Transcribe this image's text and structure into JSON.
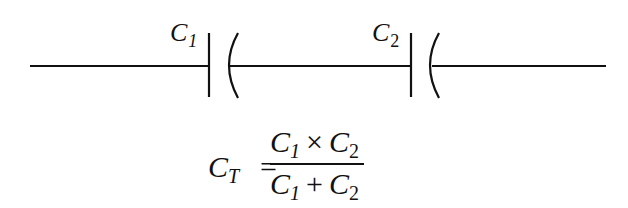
{
  "diagram": {
    "type": "series-capacitor-circuit",
    "colors": {
      "line": "#111111",
      "background": "#ffffff"
    },
    "capacitors": [
      {
        "symbol": "C",
        "subscript": "1"
      },
      {
        "symbol": "C",
        "subscript": "2"
      }
    ],
    "formula": {
      "lhs_symbol": "C",
      "lhs_subscript": "T",
      "equals": "=",
      "numerator": {
        "a": "C",
        "a_sub": "1",
        "op": "×",
        "b": "C",
        "b_sub": "2"
      },
      "denominator": {
        "a": "C",
        "a_sub": "1",
        "op": "+",
        "b": "C",
        "b_sub": "2"
      }
    }
  }
}
